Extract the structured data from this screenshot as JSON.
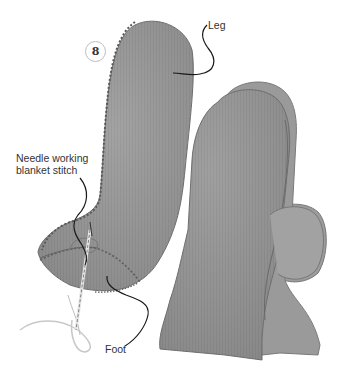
{
  "figure": {
    "step_number": "8",
    "labels": {
      "leg": "Leg",
      "needle_line1": "Needle working",
      "needle_line2": "blanket stitch",
      "foot": "Foot"
    },
    "pieces": [
      {
        "name": "front-piece",
        "description": "Boot-shaped felt piece being stitched with blanket stitch"
      },
      {
        "name": "back-piece",
        "description": "Second boot-shaped felt piece with heel tab"
      }
    ],
    "colors": {
      "felt_fill": "#8f8f8f",
      "felt_light": "#a6a6a6",
      "felt_dark": "#6f6f6f",
      "stitch": "#5a5a5a",
      "leader_line": "#1a1a1a",
      "thread": "#c8c8c8",
      "label_text": "#333333",
      "background": "#ffffff"
    }
  }
}
